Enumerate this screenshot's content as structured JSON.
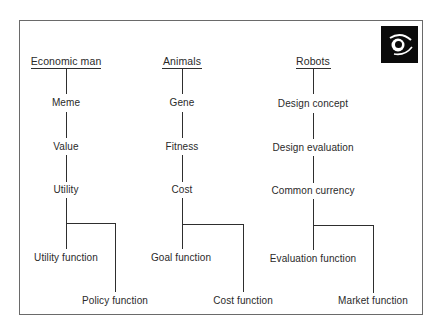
{
  "logo": {
    "icon": "eye-icon"
  },
  "columns": [
    {
      "header": "Economic man",
      "nodes": [
        "Meme",
        "Value",
        "Utility"
      ],
      "branches": [
        "Utility function",
        "Policy function"
      ]
    },
    {
      "header": "Animals",
      "nodes": [
        "Gene",
        "Fitness",
        "Cost"
      ],
      "branches": [
        "Goal function",
        "Cost function"
      ]
    },
    {
      "header": "Robots",
      "nodes": [
        "Design concept",
        "Design evaluation",
        "Common currency"
      ],
      "branches": [
        "Evaluation function",
        "Market function"
      ]
    }
  ]
}
